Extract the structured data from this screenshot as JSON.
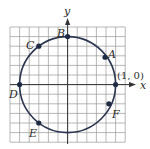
{
  "figure": {
    "type": "unit-circle-diagram",
    "axes": {
      "x_label": "x",
      "y_label": "y"
    },
    "colors": {
      "grid": "#9a9a9a",
      "axis": "#333333",
      "circle": "#2b3550",
      "point": "#1f2a44",
      "text": "#2a2a2a"
    },
    "intercept_label": "(1, 0)",
    "grid_cells": 12,
    "radius_cells": 5,
    "points": [
      {
        "name": "A",
        "x": 0.78,
        "y": 0.57
      },
      {
        "name": "B",
        "x": 0.0,
        "y": 1.0
      },
      {
        "name": "C",
        "x": -0.6,
        "y": 0.8
      },
      {
        "name": "D",
        "x": -1.0,
        "y": 0.0
      },
      {
        "name": "E",
        "x": -0.6,
        "y": -0.8
      },
      {
        "name": "F",
        "x": 0.86,
        "y": -0.4
      },
      {
        "name": "(1, 0)",
        "x": 1.0,
        "y": 0.0
      }
    ]
  }
}
